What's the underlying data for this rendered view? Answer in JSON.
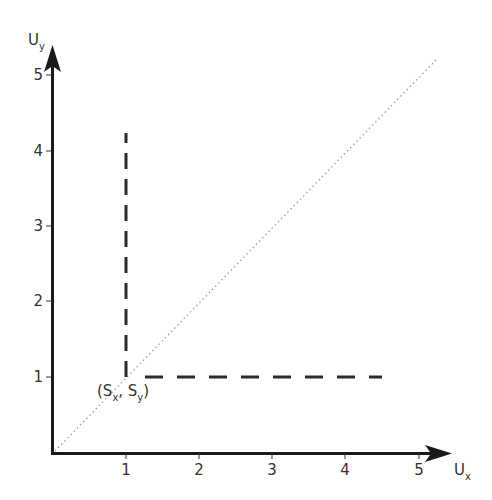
{
  "diagram": {
    "axes": {
      "x": {
        "label": "U",
        "sub": "x",
        "ticks": [
          "1",
          "2",
          "3",
          "4",
          "5"
        ]
      },
      "y": {
        "label": "U",
        "sub": "y",
        "ticks": [
          "1",
          "2",
          "3",
          "4",
          "5"
        ]
      }
    },
    "point": {
      "label_open": "(S",
      "sub_x": "x",
      "comma": ", S",
      "sub_y": "y",
      "label_close": ")",
      "x": 1,
      "y": 1
    },
    "lines": [
      {
        "name": "diagonal",
        "style": "dotted",
        "from": [
          0,
          0
        ],
        "to": [
          5.2,
          5.2
        ]
      },
      {
        "name": "vertical-dashed",
        "style": "dashed",
        "from": [
          1,
          1
        ],
        "to": [
          1,
          4.25
        ]
      },
      {
        "name": "horizontal-dashed",
        "style": "dashed",
        "from": [
          1,
          1
        ],
        "to": [
          4.5,
          1
        ]
      }
    ],
    "colors": {
      "axis": "#1a1a1a",
      "dash": "#2a2a2a",
      "dotted": "#999999",
      "text": "#333333"
    }
  }
}
